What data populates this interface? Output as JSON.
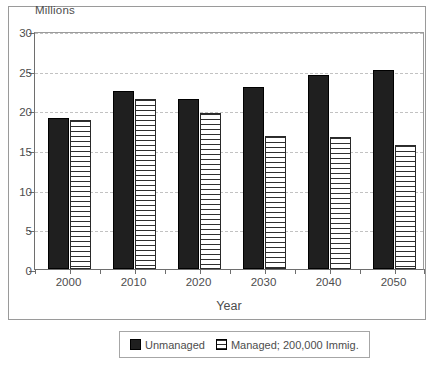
{
  "chart_data": {
    "type": "bar",
    "title": "",
    "subtitle": "",
    "unit_label": "Millions",
    "xlabel": "Year",
    "ylabel": "",
    "categories": [
      "2000",
      "2010",
      "2020",
      "2030",
      "2040",
      "2050"
    ],
    "series": [
      {
        "name": "Unmanaged",
        "fill": "solid-black",
        "color": "#1f1f1f",
        "values": [
          19.0,
          22.5,
          21.4,
          23.0,
          24.4,
          25.1
        ]
      },
      {
        "name": "Managed; 200,000 Immig.",
        "fill": "horizontal-hatch",
        "color": "#ffffff",
        "values": [
          18.8,
          21.4,
          19.7,
          16.8,
          16.6,
          15.6
        ]
      }
    ],
    "ylim": [
      0,
      30
    ],
    "yticks": [
      0,
      5,
      10,
      15,
      20,
      25,
      30
    ],
    "ytick_labels": [
      "0",
      "5",
      "10",
      "15",
      "20",
      "25",
      "30"
    ],
    "grid": "horizontal-dashed",
    "legend_position": "bottom-center",
    "frame": true
  },
  "legend": {
    "items": [
      {
        "label": "Unmanaged",
        "swatch": "solid-swatch"
      },
      {
        "label": "Managed; 200,000 Immig.",
        "swatch": "hatched-swatch"
      }
    ]
  },
  "colors": {
    "series_solid": "#1f1f1f",
    "series_hatch_line": "#2f2f2f",
    "background": "#ffffff",
    "axis": "#6e6e6e",
    "grid": "#c2c2c2",
    "text": "#4d4d4d",
    "frame": "#9a9a9a"
  }
}
